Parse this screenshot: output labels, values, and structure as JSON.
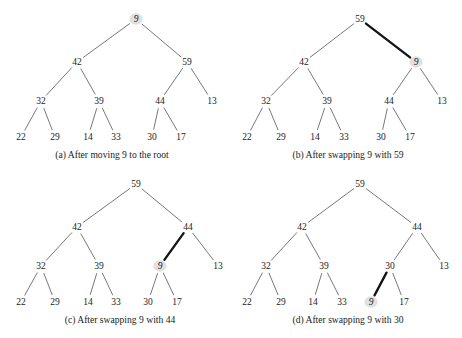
{
  "figure": {
    "width": 462,
    "height": 338,
    "background": "#ffffff",
    "edge_color": "#55555a",
    "highlight_edge_color": "#141414",
    "node_halo_color": "#dcdcdc",
    "text_color": "#1b1b1b"
  },
  "chart_data": {
    "type": "diagram",
    "subtype": "binary-heap-tree-sequence",
    "panels": [
      {
        "id": "a",
        "caption": "(a) After moving 9 to the root",
        "caption_x": 112,
        "caption_y": 158,
        "highlighted_node": "9",
        "highlight_edge": null,
        "nodes": [
          {
            "id": "n0",
            "label": "9",
            "x": 136,
            "y": 19,
            "marked": true
          },
          {
            "id": "n1",
            "label": "42",
            "x": 77,
            "y": 62,
            "marked": false
          },
          {
            "id": "n2",
            "label": "59",
            "x": 187,
            "y": 62,
            "marked": false
          },
          {
            "id": "n3",
            "label": "32",
            "x": 41,
            "y": 101,
            "marked": false
          },
          {
            "id": "n4",
            "label": "39",
            "x": 99,
            "y": 101,
            "marked": false
          },
          {
            "id": "n5",
            "label": "44",
            "x": 160,
            "y": 101,
            "marked": false
          },
          {
            "id": "n6",
            "label": "13",
            "x": 212,
            "y": 101,
            "marked": false
          },
          {
            "id": "n7",
            "label": "22",
            "x": 21,
            "y": 137,
            "marked": false
          },
          {
            "id": "n8",
            "label": "29",
            "x": 55,
            "y": 137,
            "marked": false
          },
          {
            "id": "n9",
            "label": "14",
            "x": 88,
            "y": 137,
            "marked": false
          },
          {
            "id": "n10",
            "label": "33",
            "x": 116,
            "y": 137,
            "marked": false
          },
          {
            "id": "n11",
            "label": "30",
            "x": 152,
            "y": 137,
            "marked": false
          },
          {
            "id": "n12",
            "label": "17",
            "x": 181,
            "y": 137,
            "marked": false
          }
        ],
        "edges": [
          {
            "from": "n0",
            "to": "n1",
            "highlight": false
          },
          {
            "from": "n0",
            "to": "n2",
            "highlight": false
          },
          {
            "from": "n1",
            "to": "n3",
            "highlight": false
          },
          {
            "from": "n1",
            "to": "n4",
            "highlight": false
          },
          {
            "from": "n2",
            "to": "n5",
            "highlight": false
          },
          {
            "from": "n2",
            "to": "n6",
            "highlight": false
          },
          {
            "from": "n3",
            "to": "n7",
            "highlight": false
          },
          {
            "from": "n3",
            "to": "n8",
            "highlight": false
          },
          {
            "from": "n4",
            "to": "n9",
            "highlight": false
          },
          {
            "from": "n4",
            "to": "n10",
            "highlight": false
          },
          {
            "from": "n5",
            "to": "n11",
            "highlight": false
          },
          {
            "from": "n5",
            "to": "n12",
            "highlight": false
          }
        ]
      },
      {
        "id": "b",
        "caption": "(b) After swapping 9 with 59",
        "caption_x": 348,
        "caption_y": 158,
        "highlighted_node": "9",
        "highlight_edge": "n0-n2",
        "nodes": [
          {
            "id": "n0",
            "label": "59",
            "x": 360,
            "y": 19,
            "marked": false
          },
          {
            "id": "n1",
            "label": "42",
            "x": 304,
            "y": 62,
            "marked": false
          },
          {
            "id": "n2",
            "label": "9",
            "x": 416,
            "y": 62,
            "marked": true
          },
          {
            "id": "n3",
            "label": "32",
            "x": 266,
            "y": 101,
            "marked": false
          },
          {
            "id": "n4",
            "label": "39",
            "x": 327,
            "y": 101,
            "marked": false
          },
          {
            "id": "n5",
            "label": "44",
            "x": 389,
            "y": 101,
            "marked": false
          },
          {
            "id": "n6",
            "label": "13",
            "x": 442,
            "y": 101,
            "marked": false
          },
          {
            "id": "n7",
            "label": "22",
            "x": 247,
            "y": 137,
            "marked": false
          },
          {
            "id": "n8",
            "label": "29",
            "x": 281,
            "y": 137,
            "marked": false
          },
          {
            "id": "n9",
            "label": "14",
            "x": 315,
            "y": 137,
            "marked": false
          },
          {
            "id": "n10",
            "label": "33",
            "x": 344,
            "y": 137,
            "marked": false
          },
          {
            "id": "n11",
            "label": "30",
            "x": 381,
            "y": 137,
            "marked": false
          },
          {
            "id": "n12",
            "label": "17",
            "x": 410,
            "y": 137,
            "marked": false
          }
        ],
        "edges": [
          {
            "from": "n0",
            "to": "n1",
            "highlight": false
          },
          {
            "from": "n0",
            "to": "n2",
            "highlight": true
          },
          {
            "from": "n1",
            "to": "n3",
            "highlight": false
          },
          {
            "from": "n1",
            "to": "n4",
            "highlight": false
          },
          {
            "from": "n2",
            "to": "n5",
            "highlight": false
          },
          {
            "from": "n2",
            "to": "n6",
            "highlight": false
          },
          {
            "from": "n3",
            "to": "n7",
            "highlight": false
          },
          {
            "from": "n3",
            "to": "n8",
            "highlight": false
          },
          {
            "from": "n4",
            "to": "n9",
            "highlight": false
          },
          {
            "from": "n4",
            "to": "n10",
            "highlight": false
          },
          {
            "from": "n5",
            "to": "n11",
            "highlight": false
          },
          {
            "from": "n5",
            "to": "n12",
            "highlight": false
          }
        ]
      },
      {
        "id": "c",
        "caption": "(c) After swapping 9 with 44",
        "caption_x": 120,
        "caption_y": 323,
        "highlighted_node": "9",
        "highlight_edge": "n5-n2",
        "nodes": [
          {
            "id": "n0",
            "label": "59",
            "x": 136,
            "y": 184,
            "marked": false
          },
          {
            "id": "n1",
            "label": "42",
            "x": 77,
            "y": 227,
            "marked": false
          },
          {
            "id": "n5",
            "label": "44",
            "x": 188,
            "y": 227,
            "marked": false
          },
          {
            "id": "n3",
            "label": "32",
            "x": 41,
            "y": 266,
            "marked": false
          },
          {
            "id": "n4",
            "label": "39",
            "x": 99,
            "y": 266,
            "marked": false
          },
          {
            "id": "n2",
            "label": "9",
            "x": 160,
            "y": 266,
            "marked": true
          },
          {
            "id": "n6",
            "label": "13",
            "x": 218,
            "y": 266,
            "marked": false
          },
          {
            "id": "n7",
            "label": "22",
            "x": 21,
            "y": 302,
            "marked": false
          },
          {
            "id": "n8",
            "label": "29",
            "x": 55,
            "y": 302,
            "marked": false
          },
          {
            "id": "n9",
            "label": "14",
            "x": 88,
            "y": 302,
            "marked": false
          },
          {
            "id": "n10",
            "label": "33",
            "x": 116,
            "y": 302,
            "marked": false
          },
          {
            "id": "n11",
            "label": "30",
            "x": 148,
            "y": 302,
            "marked": false
          },
          {
            "id": "n12",
            "label": "17",
            "x": 177,
            "y": 302,
            "marked": false
          }
        ],
        "edges": [
          {
            "from": "n0",
            "to": "n1",
            "highlight": false
          },
          {
            "from": "n0",
            "to": "n5",
            "highlight": false
          },
          {
            "from": "n1",
            "to": "n3",
            "highlight": false
          },
          {
            "from": "n1",
            "to": "n4",
            "highlight": false
          },
          {
            "from": "n5",
            "to": "n2",
            "highlight": true
          },
          {
            "from": "n5",
            "to": "n6",
            "highlight": false
          },
          {
            "from": "n3",
            "to": "n7",
            "highlight": false
          },
          {
            "from": "n3",
            "to": "n8",
            "highlight": false
          },
          {
            "from": "n4",
            "to": "n9",
            "highlight": false
          },
          {
            "from": "n4",
            "to": "n10",
            "highlight": false
          },
          {
            "from": "n2",
            "to": "n11",
            "highlight": false
          },
          {
            "from": "n2",
            "to": "n12",
            "highlight": false
          }
        ]
      },
      {
        "id": "d",
        "caption": "(d) After swapping 9 with 30",
        "caption_x": 348,
        "caption_y": 323,
        "highlighted_node": "9",
        "highlight_edge": "n11-n2",
        "nodes": [
          {
            "id": "n0",
            "label": "59",
            "x": 360,
            "y": 184,
            "marked": false
          },
          {
            "id": "n1",
            "label": "42",
            "x": 302,
            "y": 227,
            "marked": false
          },
          {
            "id": "n5",
            "label": "44",
            "x": 417,
            "y": 227,
            "marked": false
          },
          {
            "id": "n3",
            "label": "32",
            "x": 266,
            "y": 266,
            "marked": false
          },
          {
            "id": "n4",
            "label": "39",
            "x": 324,
            "y": 266,
            "marked": false
          },
          {
            "id": "n11",
            "label": "30",
            "x": 390,
            "y": 266,
            "marked": false
          },
          {
            "id": "n6",
            "label": "13",
            "x": 444,
            "y": 266,
            "marked": false
          },
          {
            "id": "n7",
            "label": "22",
            "x": 247,
            "y": 302,
            "marked": false
          },
          {
            "id": "n8",
            "label": "29",
            "x": 281,
            "y": 302,
            "marked": false
          },
          {
            "id": "n9",
            "label": "14",
            "x": 313,
            "y": 302,
            "marked": false
          },
          {
            "id": "n10",
            "label": "33",
            "x": 342,
            "y": 302,
            "marked": false
          },
          {
            "id": "n2",
            "label": "9",
            "x": 371,
            "y": 302,
            "marked": true
          },
          {
            "id": "n12",
            "label": "17",
            "x": 404,
            "y": 302,
            "marked": false
          }
        ],
        "edges": [
          {
            "from": "n0",
            "to": "n1",
            "highlight": false
          },
          {
            "from": "n0",
            "to": "n5",
            "highlight": false
          },
          {
            "from": "n1",
            "to": "n3",
            "highlight": false
          },
          {
            "from": "n1",
            "to": "n4",
            "highlight": false
          },
          {
            "from": "n5",
            "to": "n11",
            "highlight": false
          },
          {
            "from": "n5",
            "to": "n6",
            "highlight": false
          },
          {
            "from": "n3",
            "to": "n7",
            "highlight": false
          },
          {
            "from": "n3",
            "to": "n8",
            "highlight": false
          },
          {
            "from": "n4",
            "to": "n9",
            "highlight": false
          },
          {
            "from": "n4",
            "to": "n10",
            "highlight": false
          },
          {
            "from": "n11",
            "to": "n2",
            "highlight": true
          },
          {
            "from": "n11",
            "to": "n12",
            "highlight": false
          }
        ]
      }
    ]
  }
}
